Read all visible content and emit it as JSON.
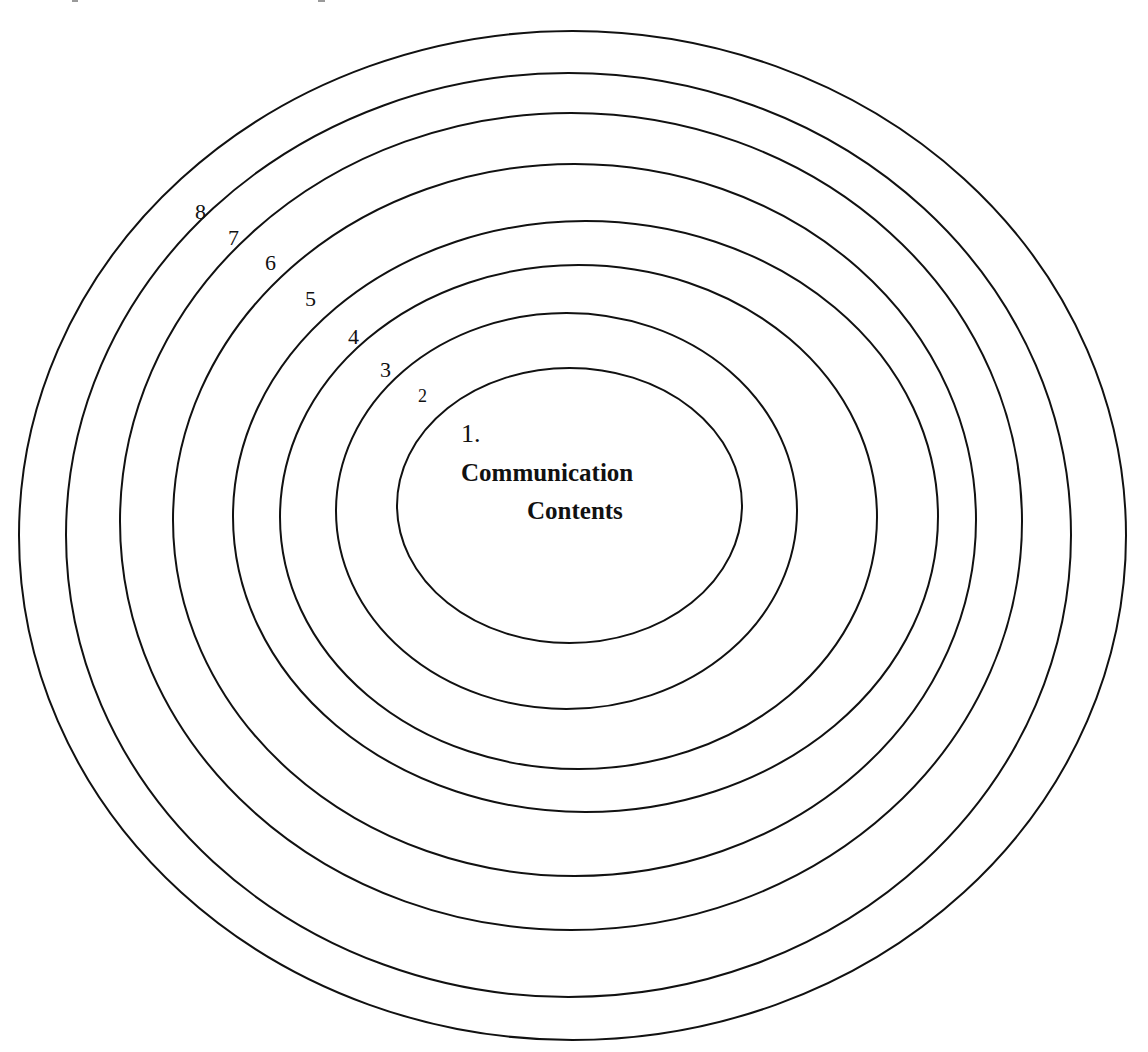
{
  "diagram": {
    "type": "concentric-ellipses",
    "stroke_color": "#111111",
    "background_color": "#ffffff",
    "core": {
      "number": "1.",
      "line1": "Communication",
      "line2": "Contents"
    },
    "rings": [
      {
        "level": 1,
        "cx": 569.5,
        "cy": 505.5,
        "rx": 172.5,
        "ry": 137.5
      },
      {
        "level": 2,
        "label": "2",
        "cx": 566.5,
        "cy": 511,
        "rx": 230.5,
        "ry": 198
      },
      {
        "level": 3,
        "label": "3",
        "cx": 578.5,
        "cy": 517,
        "rx": 298.5,
        "ry": 252
      },
      {
        "level": 4,
        "label": "4",
        "cx": 585.5,
        "cy": 516.5,
        "rx": 352.5,
        "ry": 295.5
      },
      {
        "level": 5,
        "label": "5",
        "cx": 574.5,
        "cy": 520,
        "rx": 401.5,
        "ry": 356
      },
      {
        "level": 6,
        "label": "6",
        "cx": 571,
        "cy": 521.5,
        "rx": 451,
        "ry": 408.5
      },
      {
        "level": 7,
        "label": "7",
        "cx": 568.5,
        "cy": 535,
        "rx": 502.5,
        "ry": 462
      },
      {
        "level": 8,
        "label": "8",
        "cx": 572.5,
        "cy": 535.5,
        "rx": 553.5,
        "ry": 504.5
      }
    ],
    "labels": {
      "ring2": "2",
      "ring3": "3",
      "ring4": "4",
      "ring5": "5",
      "ring6": "6",
      "ring7": "7",
      "ring8": "8"
    },
    "background_frame": {
      "x": 182,
      "y": 186,
      "width": 782,
      "height": 696
    }
  }
}
